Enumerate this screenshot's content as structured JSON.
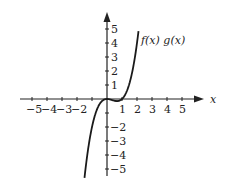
{
  "chart_data": {
    "type": "line",
    "title": "",
    "xlabel": "x",
    "ylabel": "",
    "curve_label": "f(x) g(x)",
    "function": "x^3 - x^2",
    "xlim": [
      -5,
      5
    ],
    "ylim": [
      -5,
      5
    ],
    "x_ticks": [
      "-5",
      "-4",
      "-3",
      "-2",
      "1",
      "2",
      "3",
      "4",
      "5"
    ],
    "y_ticks": [
      "5",
      "4",
      "3",
      "2",
      "1",
      "-2",
      "-3",
      "-4",
      "-5"
    ],
    "x": [
      -1.5,
      -1.25,
      -1,
      -0.75,
      -0.5,
      -0.25,
      0,
      0.25,
      0.5,
      0.67,
      0.75,
      1,
      1.25,
      1.5,
      1.75,
      2,
      2.1
    ],
    "y": [
      -5.63,
      -3.52,
      -2,
      -0.98,
      -0.38,
      -0.08,
      0,
      -0.05,
      -0.13,
      -0.15,
      -0.14,
      0,
      0.39,
      1.13,
      2.3,
      4,
      4.85
    ],
    "grid": false,
    "line_color": "#1a1a1a"
  }
}
